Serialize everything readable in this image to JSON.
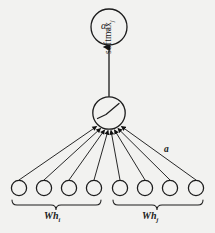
{
  "figure": {
    "background_color": "#f2f2f0",
    "stroke_color": "#1a1a1a"
  },
  "output_node": {
    "label": "α",
    "subscript": "ij",
    "name": "attention-coefficient"
  },
  "softmax": {
    "label": "softmax",
    "subscript": "j"
  },
  "activation_node": {
    "name": "leaky-relu",
    "label": ""
  },
  "attention_vector": {
    "label": "a"
  },
  "input_nodes": [
    {
      "id": 1,
      "group": "left"
    },
    {
      "id": 2,
      "group": "left"
    },
    {
      "id": 3,
      "group": "left"
    },
    {
      "id": 4,
      "group": "left"
    },
    {
      "id": 5,
      "group": "right"
    },
    {
      "id": 6,
      "group": "right"
    },
    {
      "id": 7,
      "group": "right"
    },
    {
      "id": 8,
      "group": "right"
    }
  ],
  "groups": {
    "left": {
      "label": "Wh",
      "subscript": "i"
    },
    "right": {
      "label": "Wh",
      "subscript": "j"
    }
  }
}
